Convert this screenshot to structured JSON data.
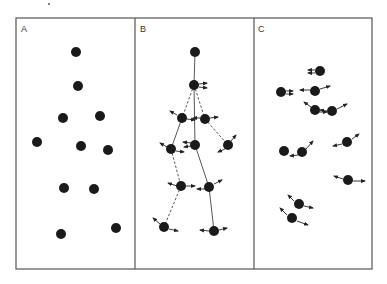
{
  "figure": {
    "frame": {
      "x": 16,
      "y": 18,
      "width": 356,
      "height": 251,
      "stroke": "#555555"
    },
    "dividers": [
      135,
      254
    ],
    "dot_color": "#1a1a1a",
    "line_color": "#444444",
    "dot_radius": 5
  },
  "panels": [
    {
      "label": "A",
      "label_pos": [
        21,
        32
      ],
      "description": "Scattered particles at rest",
      "dots": [
        [
          76,
          52
        ],
        [
          78,
          86
        ],
        [
          63,
          118
        ],
        [
          100,
          116
        ],
        [
          37,
          142
        ],
        [
          81,
          146
        ],
        [
          108,
          150
        ],
        [
          64,
          188
        ],
        [
          94,
          189
        ],
        [
          61,
          234
        ],
        [
          116,
          228
        ]
      ],
      "links": [],
      "arrows": []
    },
    {
      "label": "B",
      "label_pos": [
        140,
        32
      ],
      "description": "Particles connected by bonds with motion vectors",
      "dots": [
        [
          195,
          52
        ],
        [
          194,
          85
        ],
        [
          182,
          118
        ],
        [
          205,
          119
        ],
        [
          171,
          149
        ],
        [
          195,
          145
        ],
        [
          228,
          145
        ],
        [
          181,
          186
        ],
        [
          209,
          187
        ],
        [
          164,
          227
        ],
        [
          214,
          231
        ]
      ],
      "links": [
        {
          "from": 0,
          "to": 1,
          "dashed": false
        },
        {
          "from": 1,
          "to": 2,
          "dashed": true
        },
        {
          "from": 1,
          "to": 3,
          "dashed": true
        },
        {
          "from": 1,
          "to": 5,
          "dashed": false
        },
        {
          "from": 2,
          "to": 4,
          "dashed": false
        },
        {
          "from": 3,
          "to": 6,
          "dashed": true
        },
        {
          "from": 4,
          "to": 7,
          "dashed": true
        },
        {
          "from": 5,
          "to": 8,
          "dashed": false
        },
        {
          "from": 7,
          "to": 9,
          "dashed": true
        },
        {
          "from": 8,
          "to": 10,
          "dashed": false
        }
      ],
      "arrows": [
        [
          [
            199,
            84
          ],
          [
            207,
            83
          ]
        ],
        [
          [
            199,
            87
          ],
          [
            207,
            88
          ]
        ],
        [
          [
            177,
            115
          ],
          [
            170,
            111
          ]
        ],
        [
          [
            187,
            119
          ],
          [
            195,
            120
          ]
        ],
        [
          [
            200,
            118
          ],
          [
            193,
            118
          ]
        ],
        [
          [
            210,
            118
          ],
          [
            218,
            117
          ]
        ],
        [
          [
            167,
            147
          ],
          [
            160,
            143
          ]
        ],
        [
          [
            176,
            151
          ],
          [
            184,
            152
          ]
        ],
        [
          [
            191,
            143
          ],
          [
            183,
            142
          ]
        ],
        [
          [
            191,
            146
          ],
          [
            184,
            147
          ]
        ],
        [
          [
            231,
            141
          ],
          [
            236,
            135
          ]
        ],
        [
          [
            225,
            149
          ],
          [
            218,
            152
          ]
        ],
        [
          [
            177,
            186
          ],
          [
            168,
            183
          ]
        ],
        [
          [
            186,
            186
          ],
          [
            195,
            186
          ]
        ],
        [
          [
            205,
            189
          ],
          [
            197,
            189
          ]
        ],
        [
          [
            214,
            184
          ],
          [
            222,
            180
          ]
        ],
        [
          [
            160,
            224
          ],
          [
            153,
            218
          ]
        ],
        [
          [
            169,
            229
          ],
          [
            178,
            231
          ]
        ],
        [
          [
            209,
            231
          ],
          [
            200,
            230
          ]
        ],
        [
          [
            219,
            230
          ],
          [
            227,
            228
          ]
        ]
      ]
    },
    {
      "label": "C",
      "label_pos": [
        258,
        32
      ],
      "description": "Free particles with independent motion vectors",
      "dots": [
        [
          320,
          71
        ],
        [
          281,
          92
        ],
        [
          315,
          91
        ],
        [
          315,
          110
        ],
        [
          332,
          111
        ],
        [
          284,
          151
        ],
        [
          302,
          152
        ],
        [
          347,
          142
        ],
        [
          348,
          180
        ],
        [
          299,
          204
        ],
        [
          292,
          218
        ]
      ],
      "links": [],
      "arrows": [
        [
          [
            315,
            70
          ],
          [
            308,
            70
          ]
        ],
        [
          [
            315,
            73
          ],
          [
            308,
            73
          ]
        ],
        [
          [
            286,
            91
          ],
          [
            293,
            91
          ]
        ],
        [
          [
            286,
            94
          ],
          [
            293,
            94
          ]
        ],
        [
          [
            310,
            90
          ],
          [
            300,
            90
          ]
        ],
        [
          [
            320,
            89
          ],
          [
            330,
            86
          ]
        ],
        [
          [
            311,
            107
          ],
          [
            304,
            102
          ]
        ],
        [
          [
            319,
            112
          ],
          [
            327,
            112
          ]
        ],
        [
          [
            327,
            111
          ],
          [
            320,
            110
          ]
        ],
        [
          [
            337,
            109
          ],
          [
            347,
            104
          ]
        ],
        [
          [
            298,
            155
          ],
          [
            290,
            156
          ]
        ],
        [
          [
            306,
            149
          ],
          [
            313,
            141
          ]
        ],
        [
          [
            342,
            144
          ],
          [
            333,
            146
          ]
        ],
        [
          [
            352,
            139
          ],
          [
            359,
            134
          ]
        ],
        [
          [
            343,
            179
          ],
          [
            334,
            176
          ]
        ],
        [
          [
            353,
            181
          ],
          [
            365,
            181
          ]
        ],
        [
          [
            294,
            201
          ],
          [
            288,
            195
          ]
        ],
        [
          [
            304,
            206
          ],
          [
            313,
            208
          ]
        ],
        [
          [
            287,
            215
          ],
          [
            280,
            208
          ]
        ],
        [
          [
            297,
            221
          ],
          [
            308,
            225
          ]
        ]
      ]
    }
  ]
}
